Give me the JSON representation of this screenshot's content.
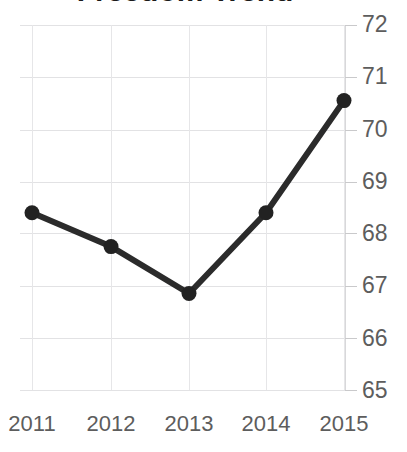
{
  "chart_title": "Freedom Trend",
  "axis": {
    "y_ticks": [
      "72",
      "71",
      "70",
      "69",
      "68",
      "67",
      "66",
      "65"
    ],
    "x_ticks": [
      "2011",
      "2012",
      "2013",
      "2014",
      "2015"
    ]
  },
  "colors": {
    "line": "#2b2b2b",
    "marker": "#222222",
    "gridline": "#e2e2e4",
    "tick_label": "#5d5d5d",
    "title": "#1a1a1a",
    "background": "#ffffff"
  },
  "chart_data": {
    "type": "line",
    "title": "Freedom Trend",
    "xlabel": "",
    "ylabel": "",
    "categories": [
      "2011",
      "2012",
      "2013",
      "2014",
      "2015"
    ],
    "x": [
      2011,
      2012,
      2013,
      2014,
      2015
    ],
    "values": [
      68.4,
      67.75,
      66.85,
      68.4,
      70.55
    ],
    "series": [
      {
        "name": "Freedom score",
        "values": [
          68.4,
          67.75,
          66.85,
          68.4,
          70.55
        ]
      }
    ],
    "ylim": [
      65,
      72
    ],
    "ytick_values": [
      72,
      71,
      70,
      69,
      68,
      67,
      66,
      65
    ],
    "grid": true,
    "legend": false,
    "markers": true
  }
}
